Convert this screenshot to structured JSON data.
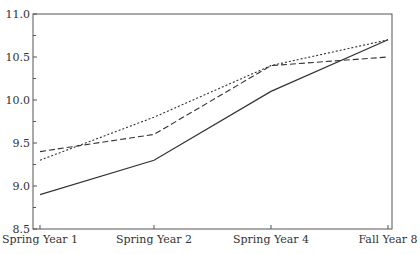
{
  "chart_data": {
    "type": "line",
    "title": "",
    "xlabel": "",
    "ylabel": "",
    "categories": [
      "Spring Year 1",
      "Spring Year 2",
      "Spring Year 4",
      "Fall Year 8"
    ],
    "ylim": [
      8.5,
      11.0
    ],
    "yticks": [
      "8.5",
      "9.0",
      "9.5",
      "10.0",
      "10.5",
      "11.0"
    ],
    "yticks_minor": [
      8.75,
      9.25,
      9.75,
      10.25,
      10.75
    ],
    "grid": false,
    "legend": null,
    "series": [
      {
        "name": "solid",
        "style": "solid",
        "color": "#333333",
        "values": [
          8.9,
          9.3,
          10.1,
          10.7
        ]
      },
      {
        "name": "dashed",
        "style": "dashed",
        "color": "#333333",
        "values": [
          9.4,
          9.6,
          10.4,
          10.5
        ]
      },
      {
        "name": "dotted",
        "style": "dotted",
        "color": "#333333",
        "values": [
          9.3,
          9.8,
          10.4,
          10.7
        ]
      }
    ]
  }
}
